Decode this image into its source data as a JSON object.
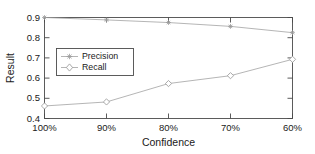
{
  "chart_data": {
    "type": "line",
    "title": "",
    "xlabel": "Confidence",
    "ylabel": "Result",
    "categories": [
      "100%",
      "90%",
      "80%",
      "70%",
      "60%"
    ],
    "xtick_labels": [
      "100%",
      "90%",
      "80%",
      "70%",
      "60%"
    ],
    "ytick_labels": [
      "0.4",
      "0.5",
      "0.6",
      "0.7",
      "0.8",
      "0.9"
    ],
    "ytick_values": [
      0.4,
      0.5,
      0.6,
      0.7,
      0.8,
      0.9
    ],
    "ylim": [
      0.4,
      0.9
    ],
    "grid": false,
    "legend_position": "upper-left-inside",
    "series": [
      {
        "name": "Precision",
        "marker": "asterisk",
        "color": "#a8a8a8",
        "values": [
          0.9,
          0.888,
          0.875,
          0.856,
          0.825
        ]
      },
      {
        "name": "Recall",
        "marker": "diamond",
        "color": "#a8a8a8",
        "values": [
          0.462,
          0.482,
          0.573,
          0.612,
          0.693
        ]
      }
    ]
  },
  "legend": {
    "entries": [
      {
        "label": "Precision"
      },
      {
        "label": "Recall"
      }
    ]
  },
  "axes": {
    "y_title": "Result",
    "x_title": "Confidence"
  }
}
